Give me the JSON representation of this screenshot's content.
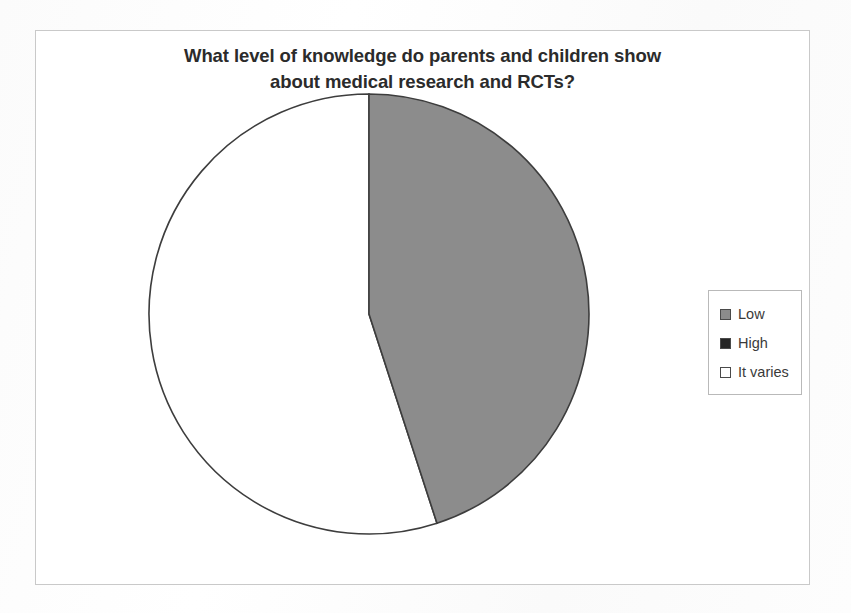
{
  "chart_data": {
    "type": "pie",
    "title": "What level of knowledge do parents and children show about medical research and RCTs?",
    "title_line1": "What level of knowledge do parents and children show",
    "title_line2": "about medical research and RCTs?",
    "categories": [
      "Low",
      "High",
      "It varies"
    ],
    "values": [
      45,
      0,
      55
    ],
    "value_unit": "percent",
    "slice_colors": [
      "#8c8c8c",
      "#262626",
      "#ffffff"
    ],
    "slice_border_color": "#3d3d3d",
    "start_angle_deg": 0,
    "direction": "clockwise",
    "legend": {
      "position": "right",
      "border_color": "#b9b9b9",
      "entries": [
        {
          "label": "Low",
          "color": "#8c8c8c"
        },
        {
          "label": "High",
          "color": "#262626"
        },
        {
          "label": "It varies",
          "color": "#ffffff"
        }
      ]
    },
    "data_labels": false,
    "grid": false,
    "xlabel": "",
    "ylabel": ""
  },
  "frame": {
    "border_color": "#c9c9c9",
    "background": "#ffffff"
  }
}
